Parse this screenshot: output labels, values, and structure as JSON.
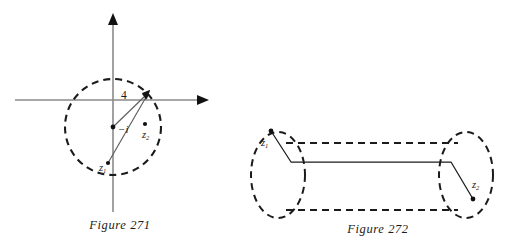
{
  "page": {
    "background_color": "#ffffff",
    "width": 511,
    "height": 246
  },
  "figures": [
    {
      "id": "figure-271",
      "caption": "Figure 271",
      "description": "Complex plane with dashed circle of radius 4 centered at -i, and two points z1 and z2 inside",
      "axes": {
        "horizontal_axis_color": "#8a8a8a",
        "vertical_axis_color": "#8a8a8a",
        "origin_x": 113,
        "origin_y": 100
      },
      "circle": {
        "center_label": "−i",
        "center_x": 113,
        "center_y": 127,
        "radius_px": 48,
        "radius_label": "4",
        "style": "dashed",
        "color": "#1b1b1b"
      },
      "points": [
        {
          "label": "z",
          "subscript": "1",
          "x": 108,
          "y": 163
        },
        {
          "label": "z",
          "subscript": "2",
          "x": 145,
          "y": 124
        },
        {
          "label": "−i",
          "subscript": "",
          "x": 113,
          "y": 127
        }
      ],
      "vectors": [
        {
          "name": "radius-arrow",
          "from_x": 113,
          "from_y": 127,
          "to_x": 148,
          "to_y": 93,
          "label": "4",
          "arrowhead": true
        },
        {
          "name": "chord-line",
          "from_x": 108,
          "from_y": 163,
          "to_x": 148,
          "to_y": 93,
          "arrowhead": false
        }
      ]
    },
    {
      "id": "figure-272",
      "caption": "Figure 272",
      "description": "Dog-bone (dumbbell) contour: two dashed loops around branch points z1 and z2 joined by a dashed channel around a solid branch cut",
      "contour": {
        "style": "dashed",
        "color": "#1b1b1b"
      },
      "branch_cut": {
        "style": "solid",
        "color": "#1b1b1b"
      },
      "points": [
        {
          "label": "z",
          "subscript": "1",
          "x": 271,
          "y": 131
        },
        {
          "label": "z",
          "subscript": "2",
          "x": 485,
          "y": 195
        }
      ]
    }
  ],
  "labels": {
    "minus_i": "−i",
    "four": "4",
    "z_letter": "z",
    "z1_sub": "1",
    "z2_sub": "2"
  }
}
